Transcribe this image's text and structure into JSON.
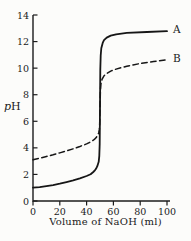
{
  "chart_data": {
    "type": "line",
    "title": "",
    "xlabel": "Volume of NaOH (ml)",
    "ylabel": "pH",
    "ylabel_p": "p",
    "ylabel_h": "H",
    "xlim": [
      0,
      100
    ],
    "ylim": [
      0,
      14
    ],
    "xticks": [
      0,
      20,
      40,
      60,
      80,
      100
    ],
    "yticks": [
      0,
      2,
      4,
      6,
      8,
      10,
      12,
      14
    ],
    "grid": false,
    "legend_position": "curve-end-labels-right",
    "background": "#fcfcfa",
    "axis_color": "#1c1c1c",
    "line_color": "#161616",
    "text_color": "#1a1a1a",
    "series": [
      {
        "name": "A",
        "style": "solid",
        "points": [
          [
            0,
            1.0
          ],
          [
            5,
            1.05
          ],
          [
            10,
            1.12
          ],
          [
            15,
            1.2
          ],
          [
            20,
            1.3
          ],
          [
            25,
            1.42
          ],
          [
            30,
            1.55
          ],
          [
            35,
            1.7
          ],
          [
            40,
            1.88
          ],
          [
            43,
            2.02
          ],
          [
            45,
            2.18
          ],
          [
            46,
            2.28
          ],
          [
            47,
            2.42
          ],
          [
            48,
            2.62
          ],
          [
            49,
            2.95
          ],
          [
            49.5,
            3.4
          ],
          [
            49.8,
            4.3
          ],
          [
            50,
            7.0
          ],
          [
            50.2,
            9.9
          ],
          [
            50.5,
            10.95
          ],
          [
            51,
            11.5
          ],
          [
            52,
            11.9
          ],
          [
            53,
            12.1
          ],
          [
            55,
            12.3
          ],
          [
            58,
            12.45
          ],
          [
            62,
            12.55
          ],
          [
            70,
            12.65
          ],
          [
            85,
            12.72
          ],
          [
            100,
            12.78
          ]
        ]
      },
      {
        "name": "B",
        "style": "dashed",
        "points": [
          [
            0,
            3.1
          ],
          [
            5,
            3.22
          ],
          [
            10,
            3.35
          ],
          [
            15,
            3.48
          ],
          [
            20,
            3.62
          ],
          [
            25,
            3.77
          ],
          [
            30,
            3.93
          ],
          [
            35,
            4.1
          ],
          [
            40,
            4.3
          ],
          [
            43,
            4.45
          ],
          [
            45,
            4.58
          ],
          [
            46,
            4.66
          ],
          [
            47,
            4.76
          ],
          [
            48,
            4.9
          ],
          [
            49,
            5.12
          ],
          [
            49.5,
            5.35
          ],
          [
            49.8,
            5.8
          ],
          [
            50,
            7.0
          ],
          [
            50.3,
            8.3
          ],
          [
            50.7,
            8.8
          ],
          [
            51.5,
            9.15
          ],
          [
            53,
            9.42
          ],
          [
            55,
            9.6
          ],
          [
            58,
            9.78
          ],
          [
            62,
            9.93
          ],
          [
            70,
            10.15
          ],
          [
            80,
            10.35
          ],
          [
            90,
            10.5
          ],
          [
            100,
            10.63
          ]
        ]
      }
    ]
  }
}
